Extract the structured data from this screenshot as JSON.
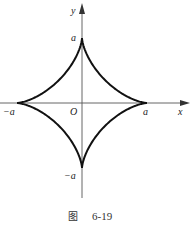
{
  "figure": {
    "caption_prefix": "图",
    "caption_number": "6-19",
    "curve": "astroid",
    "equation_hint": "x^(2/3) + y^(2/3) = a^(2/3)"
  },
  "axes": {
    "x_label": "x",
    "y_label": "y",
    "origin_label": "O"
  },
  "ticks": {
    "x_pos": "a",
    "x_neg": "−a",
    "y_pos": "a",
    "y_neg": "−a"
  },
  "colors": {
    "curve": "#111111",
    "axis": "#555555",
    "text": "#222222"
  }
}
